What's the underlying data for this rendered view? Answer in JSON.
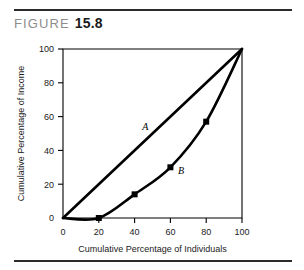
{
  "figure": {
    "label": "FIGURE",
    "number": "15.8"
  },
  "chart_data": {
    "type": "line",
    "title": "",
    "xlabel": "Cumulative Percentage of Individuals",
    "ylabel": "Cumulative Percentage of Income",
    "xlim": [
      0,
      100
    ],
    "ylim": [
      0,
      100
    ],
    "xticks": [
      0,
      20,
      40,
      60,
      80,
      100
    ],
    "yticks": [
      0,
      20,
      40,
      60,
      80,
      100
    ],
    "xtick_labels": [
      "0",
      "20",
      "40",
      "60",
      "80",
      "100"
    ],
    "ytick_labels": [
      "0",
      "20",
      "40",
      "60",
      "80",
      "100"
    ],
    "grid": false,
    "legend": "inline-annotations",
    "series": [
      {
        "name": "A",
        "description": "line of equality",
        "annotation": "A",
        "annotation_x": 46,
        "annotation_y": 52,
        "markers": false,
        "x": [
          0,
          100
        ],
        "y": [
          0,
          100
        ]
      },
      {
        "name": "B",
        "description": "Lorenz curve",
        "annotation": "B",
        "annotation_x": 66,
        "annotation_y": 26,
        "markers": true,
        "x": [
          0,
          20,
          40,
          60,
          80,
          100
        ],
        "y": [
          0,
          0,
          14,
          30,
          57,
          100
        ],
        "marker_x": [
          20,
          40,
          60,
          80
        ],
        "marker_y": [
          0,
          14,
          30,
          57
        ]
      }
    ]
  }
}
